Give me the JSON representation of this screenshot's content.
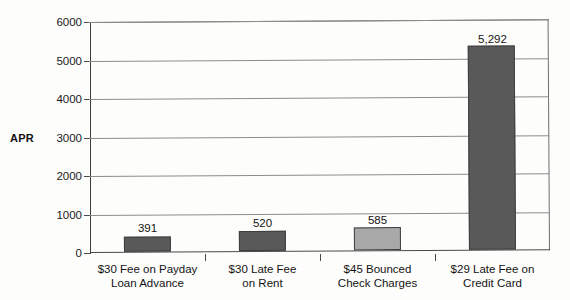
{
  "chart_data": {
    "type": "bar",
    "title": "",
    "xlabel": "",
    "ylabel": "APR",
    "ylim": [
      0,
      6000
    ],
    "grid": true,
    "legend": "none",
    "yticks": [
      6000,
      5000,
      4000,
      3000,
      2000,
      1000,
      0
    ],
    "ytick_labels": [
      "6000",
      "5000",
      "4000",
      "3000",
      "2000",
      "1000",
      "0"
    ],
    "categories": [
      "$30 Fee on Payday Loan Advance",
      "$30 Late Fee on Rent",
      "$45 Bounced Check Charges",
      "$29 Late Fee on Credit Card"
    ],
    "category_lines": [
      [
        "$30 Fee on Payday",
        "Loan Advance"
      ],
      [
        "$30 Late Fee",
        "on Rent"
      ],
      [
        "$45 Bounced",
        "Check Charges"
      ],
      [
        "$29 Late Fee on",
        "Credit Card"
      ]
    ],
    "values": [
      391,
      520,
      585,
      5292
    ],
    "value_labels": [
      "391",
      "520",
      "585",
      "5,292"
    ],
    "bar_colors": [
      "#595959",
      "#595959",
      "#a8a8a8",
      "#595959"
    ],
    "bar_border_color": "#3f3f3f"
  },
  "colors": {
    "background": "#fdfdfc",
    "axis": "#3d3d3d",
    "gridline": "#8c8c8c",
    "text": "#141414",
    "bar_dark": "#595959",
    "bar_light": "#a8a8a8"
  }
}
